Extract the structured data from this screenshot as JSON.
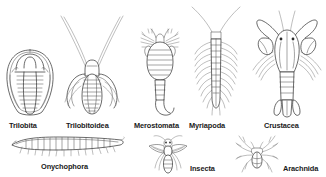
{
  "plate": {
    "title": "Arthropod classes illustration plate",
    "background_color": "#ffffff",
    "line_color": "#2b2b2b",
    "label_color": "#1a1a1a",
    "rows": [
      {
        "row": 1,
        "items": [
          {
            "label": "Trilobita",
            "icon": "trilobita-figure"
          },
          {
            "label": "Trilobitoidea",
            "icon": "trilobitoidea-figure"
          },
          {
            "label": "Merostomata",
            "icon": "merostomata-figure"
          },
          {
            "label": "Myriapoda",
            "icon": "myriapoda-figure"
          },
          {
            "label": "Crustacea",
            "icon": "crustacea-figure"
          }
        ]
      },
      {
        "row": 2,
        "items": [
          {
            "label": "Onychophora",
            "icon": "onychophora-figure"
          },
          {
            "label": "Insecta",
            "icon": "insecta-figure"
          },
          {
            "label": "Arachnida",
            "icon": "arachnida-figure"
          }
        ]
      }
    ]
  }
}
